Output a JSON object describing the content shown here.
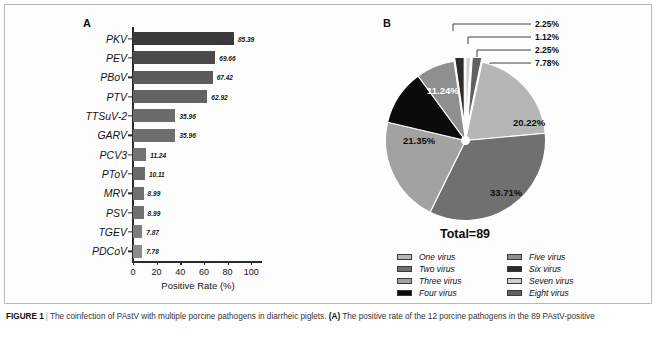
{
  "figure": {
    "caption_label": "FIGURE 1",
    "caption_text": "The coinfection of PAstV with multiple porcine pathogens in diarrheic piglets.",
    "caption_part_a_label": "(A)",
    "caption_part_a_text": "The positive rate of the 12 porcine pathogens in the 89 PAstV-positive"
  },
  "panel_a": {
    "letter": "A",
    "chart_data": {
      "type": "bar",
      "title": "",
      "orientation": "horizontal",
      "xlabel": "Positive Rate (%)",
      "ylabel": "",
      "xlim": [
        0,
        110
      ],
      "xticks": [
        0,
        20,
        40,
        60,
        80,
        100
      ],
      "xtick_labels": [
        "0",
        "20",
        "40",
        "60",
        "80",
        "100"
      ],
      "grid": false,
      "categories": [
        "PKV",
        "PEV",
        "PBoV",
        "PTV",
        "TTSuV-2",
        "GARV",
        "PCV3",
        "PToV",
        "MRV",
        "PSV",
        "TGEV",
        "PDCoV"
      ],
      "values": [
        85.39,
        69.66,
        67.42,
        62.92,
        35.96,
        35.96,
        11.24,
        10.11,
        8.99,
        8.99,
        7.87,
        7.78
      ],
      "value_labels": [
        "85.39",
        "69.66",
        "67.42",
        "62.92",
        "35.96",
        "35.96",
        "11.24",
        "10.11",
        "8.99",
        "8.99",
        "7.87",
        "7.78"
      ],
      "bar_colors": [
        "#3a3a3a",
        "#4a4a4a",
        "#5b5b5b",
        "#636363",
        "#6b6b6b",
        "#6e6e6e",
        "#737373",
        "#6a6a6a",
        "#6f6f6f",
        "#717171",
        "#7d7d7d",
        "#8c8c8c"
      ]
    }
  },
  "panel_b": {
    "letter": "B",
    "total_label": "Total=89",
    "chart_data": {
      "type": "pie",
      "title": "",
      "total": 89,
      "legend_position": "bottom",
      "labels": [
        "One virus",
        "Two virus",
        "Three virus",
        "Four virus",
        "Five virus",
        "Six virus",
        "Seven virus",
        "Eight virus"
      ],
      "values": [
        20.22,
        33.71,
        21.35,
        11.24,
        7.78,
        2.25,
        1.12,
        2.25
      ],
      "value_labels": [
        "20.22%",
        "33.71%",
        "21.35%",
        "11.24%",
        "7.78%",
        "2.25%",
        "1.12%",
        "2.25%"
      ],
      "counts": [
        18,
        30,
        19,
        10,
        7,
        2,
        1,
        2
      ],
      "colors": [
        "#b6b6b6",
        "#707070",
        "#a2a2a2",
        "#0b0b0b",
        "#8f8f8f",
        "#2c2c2c",
        "#cfcfcf",
        "#616161"
      ],
      "exploded": [
        false,
        false,
        false,
        false,
        false,
        true,
        true,
        true
      ],
      "callouts": [
        "2.25%",
        "1.12%",
        "2.25%",
        "7.78%"
      ]
    },
    "legend": [
      {
        "label": "One virus",
        "color": "#b6b6b6"
      },
      {
        "label": "Five virus",
        "color": "#8f8f8f"
      },
      {
        "label": "Two virus",
        "color": "#707070"
      },
      {
        "label": "Six virus",
        "color": "#2c2c2c"
      },
      {
        "label": "Three virus",
        "color": "#a2a2a2"
      },
      {
        "label": "Seven virus",
        "color": "#cfcfcf"
      },
      {
        "label": "Four virus",
        "color": "#0b0b0b"
      },
      {
        "label": "Eight virus",
        "color": "#616161"
      }
    ]
  }
}
